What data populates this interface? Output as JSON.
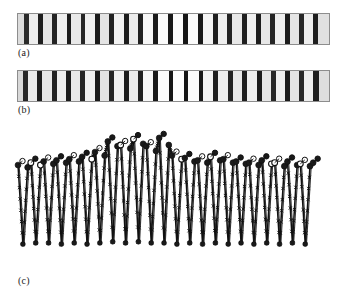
{
  "figure": {
    "background_color": "#ffffff",
    "ink_color": "#111111",
    "panel_border_color": "#8d8d8d",
    "panel_bg_color": "#efefef"
  },
  "captions": {
    "a": "(a)",
    "b": "(b)",
    "c": "(c)"
  },
  "panels": {
    "a": {
      "name": "barcode-strip-a",
      "x": 17,
      "y": 13,
      "width": 313,
      "height": 32,
      "stripes": [
        {
          "x": 0.0,
          "w": 0.018,
          "gray": "#dcdcdc"
        },
        {
          "x": 0.018,
          "w": 0.016,
          "gray": "#2a2a2a"
        },
        {
          "x": 0.034,
          "w": 0.03,
          "gray": "#ededed"
        },
        {
          "x": 0.064,
          "w": 0.017,
          "gray": "#1e1e1e"
        },
        {
          "x": 0.081,
          "w": 0.028,
          "gray": "#e6e6e6"
        },
        {
          "x": 0.109,
          "w": 0.016,
          "gray": "#242424"
        },
        {
          "x": 0.125,
          "w": 0.031,
          "gray": "#efefef"
        },
        {
          "x": 0.156,
          "w": 0.016,
          "gray": "#1c1c1c"
        },
        {
          "x": 0.172,
          "w": 0.029,
          "gray": "#e9e9e9"
        },
        {
          "x": 0.201,
          "w": 0.016,
          "gray": "#262626"
        },
        {
          "x": 0.217,
          "w": 0.031,
          "gray": "#f0f0f0"
        },
        {
          "x": 0.248,
          "w": 0.016,
          "gray": "#1b1b1b"
        },
        {
          "x": 0.264,
          "w": 0.029,
          "gray": "#e4e4e4"
        },
        {
          "x": 0.293,
          "w": 0.016,
          "gray": "#232323"
        },
        {
          "x": 0.309,
          "w": 0.031,
          "gray": "#f2f2f2"
        },
        {
          "x": 0.34,
          "w": 0.016,
          "gray": "#1d1d1d"
        },
        {
          "x": 0.356,
          "w": 0.03,
          "gray": "#ececec"
        },
        {
          "x": 0.386,
          "w": 0.016,
          "gray": "#202020"
        },
        {
          "x": 0.402,
          "w": 0.032,
          "gray": "#f6f6f6"
        },
        {
          "x": 0.434,
          "w": 0.015,
          "gray": "#1a1a1a"
        },
        {
          "x": 0.449,
          "w": 0.033,
          "gray": "#fafafa"
        },
        {
          "x": 0.482,
          "w": 0.015,
          "gray": "#181818"
        },
        {
          "x": 0.497,
          "w": 0.034,
          "gray": "#fcfcfc"
        },
        {
          "x": 0.531,
          "w": 0.015,
          "gray": "#161616"
        },
        {
          "x": 0.546,
          "w": 0.033,
          "gray": "#fafafa"
        },
        {
          "x": 0.579,
          "w": 0.015,
          "gray": "#191919"
        },
        {
          "x": 0.594,
          "w": 0.032,
          "gray": "#f4f4f4"
        },
        {
          "x": 0.626,
          "w": 0.016,
          "gray": "#1e1e1e"
        },
        {
          "x": 0.642,
          "w": 0.031,
          "gray": "#eeeeee"
        },
        {
          "x": 0.673,
          "w": 0.016,
          "gray": "#222222"
        },
        {
          "x": 0.689,
          "w": 0.03,
          "gray": "#e8e8e8"
        },
        {
          "x": 0.719,
          "w": 0.016,
          "gray": "#1f1f1f"
        },
        {
          "x": 0.735,
          "w": 0.031,
          "gray": "#f0f0f0"
        },
        {
          "x": 0.766,
          "w": 0.016,
          "gray": "#1d1d1d"
        },
        {
          "x": 0.782,
          "w": 0.029,
          "gray": "#e7e7e7"
        },
        {
          "x": 0.811,
          "w": 0.016,
          "gray": "#252525"
        },
        {
          "x": 0.827,
          "w": 0.031,
          "gray": "#efefef"
        },
        {
          "x": 0.858,
          "w": 0.016,
          "gray": "#1c1c1c"
        },
        {
          "x": 0.874,
          "w": 0.029,
          "gray": "#e5e5e5"
        },
        {
          "x": 0.903,
          "w": 0.016,
          "gray": "#272727"
        },
        {
          "x": 0.919,
          "w": 0.031,
          "gray": "#eeeeee"
        },
        {
          "x": 0.95,
          "w": 0.016,
          "gray": "#1e1e1e"
        },
        {
          "x": 0.966,
          "w": 0.034,
          "gray": "#e0e0e0"
        }
      ]
    },
    "b": {
      "name": "barcode-strip-b",
      "x": 17,
      "y": 70,
      "width": 313,
      "height": 32,
      "stripes": [
        {
          "x": 0.0,
          "w": 0.015,
          "gray": "#d8d8d8"
        },
        {
          "x": 0.015,
          "w": 0.017,
          "gray": "#262626"
        },
        {
          "x": 0.032,
          "w": 0.029,
          "gray": "#eaeaea"
        },
        {
          "x": 0.061,
          "w": 0.017,
          "gray": "#1d1d1d"
        },
        {
          "x": 0.078,
          "w": 0.03,
          "gray": "#e7e7e7"
        },
        {
          "x": 0.108,
          "w": 0.016,
          "gray": "#222222"
        },
        {
          "x": 0.124,
          "w": 0.03,
          "gray": "#ededed"
        },
        {
          "x": 0.154,
          "w": 0.017,
          "gray": "#1b1b1b"
        },
        {
          "x": 0.171,
          "w": 0.029,
          "gray": "#e8e8e8"
        },
        {
          "x": 0.2,
          "w": 0.016,
          "gray": "#242424"
        },
        {
          "x": 0.216,
          "w": 0.031,
          "gray": "#efefef"
        },
        {
          "x": 0.247,
          "w": 0.016,
          "gray": "#1a1a1a"
        },
        {
          "x": 0.263,
          "w": 0.029,
          "gray": "#e3e3e3"
        },
        {
          "x": 0.292,
          "w": 0.016,
          "gray": "#252525"
        },
        {
          "x": 0.308,
          "w": 0.032,
          "gray": "#f1f1f1"
        },
        {
          "x": 0.34,
          "w": 0.016,
          "gray": "#1c1c1c"
        },
        {
          "x": 0.356,
          "w": 0.03,
          "gray": "#ebebeb"
        },
        {
          "x": 0.386,
          "w": 0.016,
          "gray": "#202020"
        },
        {
          "x": 0.402,
          "w": 0.033,
          "gray": "#f7f7f7"
        },
        {
          "x": 0.435,
          "w": 0.014,
          "gray": "#191919"
        },
        {
          "x": 0.449,
          "w": 0.035,
          "gray": "#fbfbfb"
        },
        {
          "x": 0.484,
          "w": 0.014,
          "gray": "#171717"
        },
        {
          "x": 0.498,
          "w": 0.035,
          "gray": "#fdfdfd"
        },
        {
          "x": 0.533,
          "w": 0.014,
          "gray": "#151515"
        },
        {
          "x": 0.547,
          "w": 0.034,
          "gray": "#fafafa"
        },
        {
          "x": 0.581,
          "w": 0.015,
          "gray": "#181818"
        },
        {
          "x": 0.596,
          "w": 0.032,
          "gray": "#f3f3f3"
        },
        {
          "x": 0.628,
          "w": 0.016,
          "gray": "#1e1e1e"
        },
        {
          "x": 0.644,
          "w": 0.03,
          "gray": "#ededed"
        },
        {
          "x": 0.674,
          "w": 0.016,
          "gray": "#232323"
        },
        {
          "x": 0.69,
          "w": 0.03,
          "gray": "#e9e9e9"
        },
        {
          "x": 0.72,
          "w": 0.016,
          "gray": "#1f1f1f"
        },
        {
          "x": 0.736,
          "w": 0.031,
          "gray": "#efefef"
        },
        {
          "x": 0.767,
          "w": 0.016,
          "gray": "#1c1c1c"
        },
        {
          "x": 0.783,
          "w": 0.029,
          "gray": "#e6e6e6"
        },
        {
          "x": 0.812,
          "w": 0.016,
          "gray": "#262626"
        },
        {
          "x": 0.828,
          "w": 0.031,
          "gray": "#eeeeee"
        },
        {
          "x": 0.859,
          "w": 0.016,
          "gray": "#1b1b1b"
        },
        {
          "x": 0.875,
          "w": 0.029,
          "gray": "#e4e4e4"
        },
        {
          "x": 0.904,
          "w": 0.016,
          "gray": "#282828"
        },
        {
          "x": 0.92,
          "w": 0.03,
          "gray": "#ededed"
        },
        {
          "x": 0.95,
          "w": 0.017,
          "gray": "#1d1d1d"
        },
        {
          "x": 0.967,
          "w": 0.033,
          "gray": "#dedede"
        }
      ]
    }
  },
  "chart_data": {
    "type": "line",
    "title": "",
    "xlabel": "",
    "ylabel": "",
    "grid": false,
    "legend": null,
    "axes_visible": false,
    "xlim": [
      0,
      24
    ],
    "ylim": [
      0,
      1
    ],
    "series": [
      {
        "name": "intensity-profile",
        "line_color": "#111111",
        "marker": "circle",
        "x": [
          0.0,
          0.38,
          0.75,
          1.0,
          1.38,
          1.75,
          2.0,
          2.38,
          2.75,
          3.0,
          3.38,
          3.75,
          4.0,
          4.38,
          4.75,
          5.0,
          5.38,
          5.75,
          6.0,
          6.38,
          6.75,
          7.0,
          7.38,
          7.75,
          8.0,
          8.38,
          8.75,
          9.0,
          9.38,
          9.75,
          10.0,
          10.38,
          10.75,
          11.0,
          11.38,
          11.75,
          12.0,
          12.38,
          12.75,
          13.0,
          13.38,
          13.75,
          14.0,
          14.38,
          14.75,
          15.0,
          15.38,
          15.75,
          16.0,
          16.38,
          16.75,
          17.0,
          17.38,
          17.75,
          18.0,
          18.38,
          18.75,
          19.0,
          19.38,
          19.75,
          20.0,
          20.38,
          20.75,
          21.0,
          21.38,
          21.75,
          22.0,
          22.38,
          22.75,
          23.0
        ],
        "y": [
          0.72,
          0.05,
          0.7,
          0.74,
          0.06,
          0.72,
          0.75,
          0.06,
          0.73,
          0.76,
          0.05,
          0.74,
          0.77,
          0.06,
          0.75,
          0.79,
          0.05,
          0.77,
          0.83,
          0.06,
          0.8,
          0.92,
          0.07,
          0.88,
          0.89,
          0.06,
          0.86,
          0.94,
          0.07,
          0.9,
          0.88,
          0.06,
          0.84,
          0.95,
          0.06,
          0.89,
          0.8,
          0.05,
          0.77,
          0.78,
          0.06,
          0.75,
          0.76,
          0.05,
          0.74,
          0.79,
          0.06,
          0.76,
          0.77,
          0.05,
          0.74,
          0.75,
          0.06,
          0.73,
          0.74,
          0.05,
          0.72,
          0.76,
          0.06,
          0.73,
          0.74,
          0.05,
          0.71,
          0.75,
          0.06,
          0.72,
          0.73,
          0.05,
          0.71,
          0.74
        ]
      }
    ],
    "peaks": {
      "count": 23,
      "filled_marker_color": "#1a1a1a",
      "open_marker_color": "#ffffff",
      "open_marker_stroke": "#111111"
    },
    "marker_sets": [
      {
        "name": "filled-circles",
        "style": "filled",
        "color": "#1a1a1a"
      },
      {
        "name": "open-circles",
        "style": "open",
        "color": "#ffffff",
        "stroke": "#111111"
      },
      {
        "name": "cross-ticks",
        "style": "x",
        "color": "#111111"
      }
    ]
  }
}
